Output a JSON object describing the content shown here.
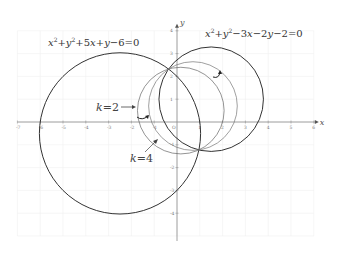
{
  "figure": {
    "origin_px": [
      177,
      122
    ],
    "unit_px": 22.8,
    "x_axis": {
      "label": "x",
      "min": -7,
      "max": 6,
      "ticks": [
        "-7",
        "-6",
        "-5",
        "-4",
        "-3",
        "-2",
        "-1",
        "1",
        "2",
        "3",
        "4",
        "5",
        "6"
      ]
    },
    "y_axis": {
      "label": "y",
      "min": -5,
      "max": 4,
      "ticks": [
        "4",
        "3",
        "2",
        "1",
        "-1",
        "-2",
        "-3",
        "-4"
      ]
    },
    "grid": true
  },
  "circles": [
    {
      "name": "circle-s1",
      "equation": "x²+y²+5x+y−6=0",
      "center": [
        -2.5,
        -0.5
      ],
      "radius": 3.536,
      "stroke": "#333333",
      "width": 1.0
    },
    {
      "name": "circle-s2",
      "equation": "x²+y²−3x−2y−2=0",
      "center": [
        1.5,
        1.0
      ],
      "radius": 2.291,
      "stroke": "#333333",
      "width": 1.0
    },
    {
      "name": "circle-k2",
      "k": 2,
      "center": [
        0.1667,
        0.5
      ],
      "radius": 1.9,
      "stroke": "#666666",
      "width": 0.7
    },
    {
      "name": "circle-k4",
      "k": 4,
      "center": [
        0.7,
        0.7
      ],
      "radius": 1.944,
      "stroke": "#777777",
      "width": 0.7
    }
  ],
  "labels": {
    "eq1": {
      "parts": [
        "x",
        "2",
        "+",
        "y",
        "2",
        "+5",
        "x",
        "+",
        "y",
        "−6=0"
      ]
    },
    "eq2": {
      "parts": [
        "x",
        "2",
        "+",
        "y",
        "2",
        "−3",
        "x",
        "−2",
        "y",
        "−2=0"
      ]
    },
    "k2": {
      "var": "k",
      "rest": "=2"
    },
    "k4": {
      "var": "k",
      "rest": "=4"
    }
  }
}
